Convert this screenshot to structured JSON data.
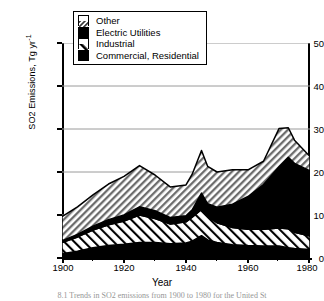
{
  "chart_data": {
    "type": "area",
    "title": "",
    "xlabel": "Year",
    "ylabel": "SO2 Emissions, Tg yr",
    "ylabel_sup": "-1",
    "xlim": [
      1900,
      1980
    ],
    "ylim": [
      0,
      50
    ],
    "grid": true,
    "stacked": true,
    "legend_position": "top-center",
    "xticks": [
      1900,
      1920,
      1940,
      1960,
      1980
    ],
    "yticks": [
      0,
      10,
      20,
      30,
      40,
      50
    ],
    "x": [
      1900,
      1905,
      1910,
      1915,
      1920,
      1925,
      1930,
      1935,
      1940,
      1942,
      1945,
      1947,
      1950,
      1955,
      1960,
      1965,
      1970,
      1973,
      1975,
      1980
    ],
    "series": [
      {
        "name": "Commercial, Residential",
        "pattern": "solid-black",
        "color": "#000000",
        "values": [
          1.0,
          1.6,
          2.4,
          2.9,
          3.2,
          3.6,
          3.6,
          3.3,
          3.5,
          3.9,
          5.2,
          4.2,
          3.6,
          3.1,
          2.9,
          2.8,
          2.8,
          2.4,
          2.2,
          2.0
        ]
      },
      {
        "name": "Industrial",
        "pattern": "diagonal-stripe",
        "color": "#ffffff",
        "values": [
          2.6,
          3.3,
          4.1,
          4.8,
          5.4,
          6.4,
          5.6,
          4.6,
          4.9,
          5.6,
          6.1,
          5.4,
          4.6,
          4.0,
          3.8,
          3.9,
          4.2,
          4.4,
          3.8,
          3.1
        ]
      },
      {
        "name": "Electric Utilities",
        "pattern": "solid-black",
        "color": "#000000",
        "values": [
          0.4,
          0.6,
          0.9,
          1.2,
          1.4,
          1.9,
          1.8,
          1.5,
          1.4,
          1.7,
          3.8,
          3.0,
          3.6,
          5.4,
          7.6,
          10.4,
          14.2,
          16.6,
          16.0,
          15.2
        ]
      },
      {
        "name": "Other",
        "pattern": "cross-hatch",
        "color": "#b8b8b8",
        "values": [
          5.6,
          6.4,
          7.3,
          8.3,
          9.0,
          9.6,
          8.3,
          7.1,
          7.2,
          8.3,
          9.9,
          8.7,
          8.2,
          8.0,
          6.2,
          5.4,
          8.9,
          6.9,
          5.4,
          3.3
        ]
      }
    ],
    "totals": [
      9.6,
      11.9,
      14.7,
      17.2,
      19.0,
      21.5,
      19.3,
      16.5,
      17.0,
      19.5,
      25.0,
      21.3,
      20.0,
      20.5,
      20.5,
      22.5,
      30.1,
      30.3,
      27.4,
      23.6
    ]
  },
  "legend": {
    "items": [
      {
        "label": "Other",
        "swatch": "cross-hatch-swatch"
      },
      {
        "label": "Electric Utilities",
        "swatch": "solid-black-swatch"
      },
      {
        "label": "Industrial",
        "swatch": "diagonal-stripe-swatch"
      },
      {
        "label": "Commercial, Residential",
        "swatch": "solid-black-swatch"
      }
    ]
  },
  "axes": {
    "y_title": "SO2 Emissions, Tg yr",
    "y_title_sup": "-1",
    "x_title": "Year",
    "y_tick_labels": [
      "50",
      "40",
      "30",
      "20",
      "10",
      "0"
    ],
    "x_tick_labels": [
      "1900",
      "1920",
      "1940",
      "1960",
      "1980"
    ]
  },
  "caption": {
    "text": "8.1   Trends in SO2 emissions from 1900 to 1980 for the United St"
  }
}
